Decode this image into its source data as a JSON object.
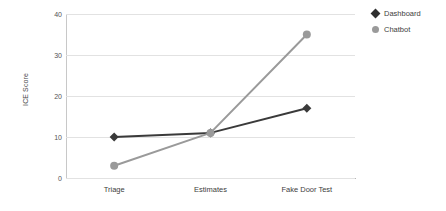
{
  "chart_data": {
    "type": "line",
    "title": "",
    "xlabel": "",
    "ylabel": "ICE Score",
    "categories": [
      "Triage",
      "Estimates",
      "Fake Door Test"
    ],
    "ylim": [
      0,
      40
    ],
    "yticks": [
      0,
      10,
      20,
      30,
      40
    ],
    "ytick_labels": [
      "0",
      "10",
      "20",
      "30",
      "40"
    ],
    "grid": true,
    "legend_position": "right",
    "series": [
      {
        "name": "Dashboard",
        "values": [
          10,
          11,
          17
        ],
        "color": "#3a3a3a",
        "marker": "diamond"
      },
      {
        "name": "Chatbot",
        "values": [
          3,
          11,
          35
        ],
        "color": "#9a9a9a",
        "marker": "circle"
      }
    ]
  },
  "legend": {
    "items": [
      {
        "label": "Dashboard",
        "marker": "diamond-marker-icon",
        "color": "#2f2f2f"
      },
      {
        "label": "Chatbot",
        "marker": "circle-marker-icon",
        "color": "#9a9a9a"
      }
    ]
  },
  "colors": {
    "background": "#ffffff",
    "gridline": "#e2e2e2",
    "axis": "#b5b5b5",
    "text": "#3d3d3d",
    "dashboard": "#3a3a3a",
    "chatbot": "#9a9a9a"
  }
}
